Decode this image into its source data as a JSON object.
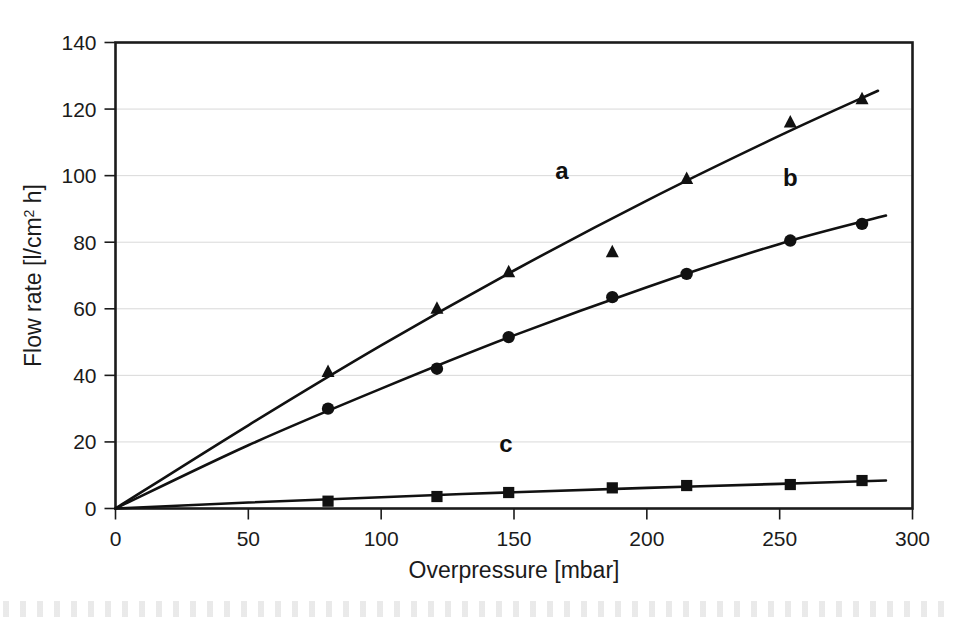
{
  "chart_data": {
    "type": "scatter",
    "title": "",
    "xlabel": "Overpressure [mbar]",
    "ylabel": "Flow rate [l/cm² h]",
    "ylabel_parts": {
      "pre": "Flow rate [l/cm",
      "sup": "2",
      "post": " h]"
    },
    "xlim": [
      0,
      300
    ],
    "ylim": [
      0,
      140
    ],
    "xticks": [
      0,
      50,
      100,
      150,
      200,
      250,
      300
    ],
    "yticks": [
      0,
      20,
      40,
      60,
      80,
      100,
      120,
      140
    ],
    "xtick_labels": [
      "0",
      "50",
      "100",
      "150",
      "200",
      "250",
      "300"
    ],
    "ytick_labels": [
      "0",
      "20",
      "40",
      "60",
      "80",
      "100",
      "120",
      "140"
    ],
    "grid": "horizontal",
    "legend": "inline-annotations",
    "series": [
      {
        "name": "a",
        "marker": "triangle",
        "color": "#111111",
        "annotation": {
          "text": "a",
          "x": 168,
          "y": 99
        },
        "points": [
          {
            "x": 80,
            "y": 41
          },
          {
            "x": 121,
            "y": 60
          },
          {
            "x": 148,
            "y": 71
          },
          {
            "x": 187,
            "y": 77
          },
          {
            "x": 215,
            "y": 99
          },
          {
            "x": 254,
            "y": 116
          },
          {
            "x": 281,
            "y": 123
          }
        ],
        "fit": [
          {
            "x": 0,
            "y": 0
          },
          {
            "x": 50,
            "y": 25
          },
          {
            "x": 100,
            "y": 49
          },
          {
            "x": 150,
            "y": 71.5
          },
          {
            "x": 200,
            "y": 92.5
          },
          {
            "x": 250,
            "y": 112
          },
          {
            "x": 287,
            "y": 125.5
          }
        ]
      },
      {
        "name": "b",
        "marker": "circle",
        "color": "#111111",
        "annotation": {
          "text": "b",
          "x": 254,
          "y": 97
        },
        "points": [
          {
            "x": 80,
            "y": 30
          },
          {
            "x": 121,
            "y": 42
          },
          {
            "x": 148,
            "y": 51.5
          },
          {
            "x": 187,
            "y": 63.5
          },
          {
            "x": 215,
            "y": 70.5
          },
          {
            "x": 254,
            "y": 80.5
          },
          {
            "x": 281,
            "y": 85.5
          }
        ],
        "fit": [
          {
            "x": 0,
            "y": 0
          },
          {
            "x": 50,
            "y": 19
          },
          {
            "x": 100,
            "y": 36
          },
          {
            "x": 150,
            "y": 52
          },
          {
            "x": 200,
            "y": 66.5
          },
          {
            "x": 250,
            "y": 79.5
          },
          {
            "x": 290,
            "y": 88
          }
        ]
      },
      {
        "name": "c",
        "marker": "square",
        "color": "#111111",
        "annotation": {
          "text": "c",
          "x": 147,
          "y": 17
        },
        "points": [
          {
            "x": 80,
            "y": 2.2
          },
          {
            "x": 121,
            "y": 3.6
          },
          {
            "x": 148,
            "y": 4.8
          },
          {
            "x": 187,
            "y": 6.2
          },
          {
            "x": 215,
            "y": 6.9
          },
          {
            "x": 254,
            "y": 7.2
          },
          {
            "x": 281,
            "y": 8.4
          }
        ],
        "fit": [
          {
            "x": 0,
            "y": 0
          },
          {
            "x": 50,
            "y": 1.8
          },
          {
            "x": 100,
            "y": 3.4
          },
          {
            "x": 150,
            "y": 4.9
          },
          {
            "x": 200,
            "y": 6.2
          },
          {
            "x": 250,
            "y": 7.4
          },
          {
            "x": 290,
            "y": 8.4
          }
        ]
      }
    ]
  },
  "colors": {
    "ink": "#111111",
    "grid": "#d9d9d9",
    "axis": "#1b1b1b",
    "background": "#ffffff"
  }
}
